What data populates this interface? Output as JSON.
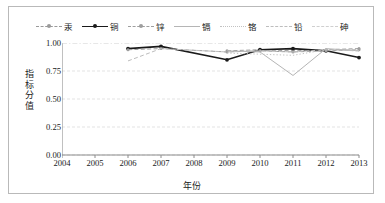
{
  "chart_data": {
    "type": "line",
    "title": "",
    "subtitle": "",
    "xlabel": "年份",
    "ylabel": "指标分值",
    "x": [
      2004,
      2005,
      2006,
      2007,
      2008,
      2009,
      2010,
      2011,
      2012,
      2013
    ],
    "xtick_labels": [
      "2004",
      "2005",
      "2006",
      "2007",
      "2008",
      "2009",
      "2010",
      "2011",
      "2012",
      "2013"
    ],
    "ytick_labels": [
      "0.00",
      "0.25",
      "0.50",
      "0.75",
      "1.00"
    ],
    "ytick_values": [
      0.0,
      0.25,
      0.5,
      0.75,
      1.0
    ],
    "ylim": [
      0.0,
      1.0
    ],
    "xlim": [
      2004,
      2013
    ],
    "grid": "horizontal",
    "legend_position": "top-center",
    "series": [
      {
        "name": "汞",
        "color": "#9a9a9a",
        "style": "dashed",
        "marker": "dot",
        "x": [
          2009,
          2010,
          2011,
          2012,
          2013
        ],
        "values": [
          0.93,
          0.94,
          0.93,
          0.94,
          0.95
        ]
      },
      {
        "name": "铜",
        "color": "#1a1a1a",
        "style": "solid",
        "marker": "dot",
        "x": [
          2006,
          2007,
          2009,
          2010,
          2011,
          2012,
          2013
        ],
        "values": [
          0.95,
          0.97,
          0.85,
          0.94,
          0.95,
          0.93,
          0.87
        ]
      },
      {
        "name": "锌",
        "color": "#9e9e9e",
        "style": "dashed",
        "marker": "dot",
        "x": [
          2006,
          2007,
          2009,
          2010,
          2011,
          2012,
          2013
        ],
        "values": [
          0.94,
          0.95,
          0.92,
          0.93,
          0.92,
          0.93,
          0.94
        ]
      },
      {
        "name": "镉",
        "color": "#b5b5b5",
        "style": "solid",
        "marker": "none",
        "x": [
          2009,
          2010,
          2011,
          2012,
          2013
        ],
        "values": [
          0.93,
          0.92,
          0.71,
          0.95,
          0.93
        ]
      },
      {
        "name": "铬",
        "color": "#c2c2c2",
        "style": "dotted",
        "marker": "none",
        "x": [
          2009,
          2010,
          2011,
          2012,
          2013
        ],
        "values": [
          0.91,
          0.9,
          0.89,
          0.94,
          0.93
        ]
      },
      {
        "name": "铅",
        "color": "#bdbdbd",
        "style": "dashed",
        "marker": "none",
        "x": [
          2006,
          2007,
          2009,
          2010,
          2011,
          2012,
          2013
        ],
        "values": [
          0.84,
          0.95,
          0.92,
          0.93,
          0.92,
          0.94,
          0.93
        ]
      },
      {
        "name": "砷",
        "color": "#cfcfcf",
        "style": "dashdot",
        "marker": "none",
        "x": [
          2004,
          2005,
          2006,
          2007,
          2008,
          2009,
          2010,
          2011,
          2012,
          2013
        ],
        "values": [
          1.0,
          1.0,
          1.0,
          1.0,
          1.0,
          1.0,
          1.0,
          1.0,
          1.0,
          1.0
        ]
      }
    ]
  },
  "colors": {
    "axis": "#8c8c8c",
    "grid": "#dcdcdc",
    "text": "#1a1a1a",
    "frame": "#b9b9b9",
    "background": "#ffffff"
  }
}
